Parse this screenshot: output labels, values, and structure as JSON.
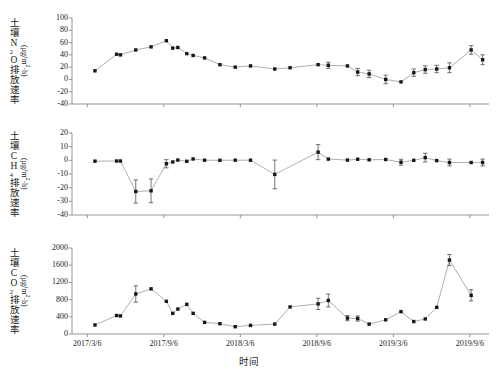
{
  "figure": {
    "xaxis_title": "时间",
    "xtick_labels": [
      "2017/3/6",
      "2017/9/6",
      "2018/3/6",
      "2018/9/6",
      "2019/3/6",
      "2019/9/6"
    ],
    "xtick_values": [
      0,
      6,
      12,
      18,
      24,
      30
    ],
    "xlim": [
      -1.2,
      31.5
    ]
  },
  "chart_data": [
    {
      "type": "line",
      "panel": "a",
      "title": "",
      "ylabel": "土壤N2O排放速率",
      "ylabel_cn_parts": [
        "土壤N",
        "2",
        "O排放速率"
      ],
      "yunit": "(μg/m2·h)",
      "xlabel": "",
      "ylim": [
        -40,
        100
      ],
      "yticks": [
        100,
        80,
        60,
        40,
        20,
        0,
        -20,
        -40
      ],
      "grid": false,
      "legend": "none",
      "x": [
        0.6,
        2.3,
        2.6,
        3.8,
        5.0,
        6.2,
        6.7,
        7.1,
        7.8,
        8.3,
        9.2,
        10.4,
        11.6,
        12.8,
        14.7,
        15.9,
        18.1,
        18.9,
        20.4,
        21.2,
        22.1,
        23.4,
        24.6,
        25.6,
        26.5,
        27.4,
        28.4,
        30.1
      ],
      "values": [
        14,
        41,
        40,
        48,
        53,
        63,
        51,
        52,
        42,
        39,
        35,
        24,
        20,
        22,
        17,
        19,
        24,
        23,
        22,
        12,
        9,
        0,
        -4,
        11,
        16,
        17,
        19,
        48
      ],
      "errors": [
        0,
        0,
        0,
        0,
        0,
        0,
        0,
        0,
        0,
        0,
        0,
        0,
        0,
        0,
        0,
        0,
        0,
        5,
        0,
        6,
        6,
        7,
        0,
        6,
        6,
        6,
        8,
        7
      ],
      "last_point": {
        "x": 31.0,
        "value": 32,
        "error": 8
      }
    },
    {
      "type": "line",
      "panel": "b",
      "title": "",
      "ylabel": "土壤CH4排放速率",
      "ylabel_cn_parts": [
        "土壤CH",
        "4",
        "排放速率"
      ],
      "yunit": "(μg/m2·h)",
      "xlabel": "",
      "ylim": [
        -40,
        20
      ],
      "yticks": [
        20,
        10,
        0,
        -10,
        -20,
        -30,
        -40
      ],
      "grid": false,
      "legend": "none",
      "x": [
        0.6,
        2.3,
        2.6,
        3.8,
        5.0,
        6.2,
        6.7,
        7.1,
        7.8,
        8.3,
        9.2,
        10.4,
        11.6,
        12.8,
        14.7,
        18.1,
        18.9,
        20.4,
        21.2,
        22.1,
        23.4,
        24.6,
        25.6,
        26.5,
        27.4,
        28.4,
        30.1,
        31.0
      ],
      "values": [
        -0.6,
        -0.5,
        -0.5,
        -22.8,
        -22.3,
        -2.5,
        -1.2,
        0.2,
        -0.7,
        1.0,
        0.1,
        0.0,
        0.1,
        0.1,
        -10.3,
        6.0,
        0.9,
        0.2,
        0.8,
        0.4,
        0.6,
        -1.4,
        0.0,
        2.0,
        -0.2,
        -1.6,
        -1.6,
        -1.6
      ],
      "errors": [
        0,
        0,
        0,
        8.5,
        8.7,
        3.0,
        0,
        0,
        0,
        0,
        0,
        0,
        0,
        0,
        10.5,
        5.5,
        0,
        0,
        0,
        0,
        0,
        2.2,
        0,
        3.2,
        0,
        2.5,
        0,
        2.5
      ]
    },
    {
      "type": "line",
      "panel": "c",
      "title": "",
      "ylabel": "土壤CO2排放速率",
      "ylabel_cn_parts": [
        "土壤CO",
        "2",
        "排放速率"
      ],
      "yunit": "(μg/m2·h)",
      "xlabel": "时间",
      "ylim": [
        0,
        2000
      ],
      "yticks": [
        2000,
        1600,
        1200,
        800,
        400,
        0
      ],
      "grid": false,
      "legend": "none",
      "x": [
        0.6,
        2.3,
        2.6,
        3.8,
        5.0,
        6.2,
        6.7,
        7.1,
        7.8,
        8.3,
        9.2,
        10.4,
        11.6,
        12.8,
        14.7,
        15.9,
        18.1,
        18.9,
        20.4,
        21.2,
        22.1,
        23.4,
        24.6,
        25.6,
        26.5,
        27.4,
        28.4,
        30.1
      ],
      "values": [
        210,
        430,
        420,
        930,
        1050,
        760,
        480,
        580,
        690,
        480,
        270,
        240,
        170,
        200,
        230,
        630,
        700,
        780,
        370,
        360,
        230,
        330,
        520,
        290,
        350,
        620,
        1720,
        900
      ],
      "errors": [
        0,
        0,
        0,
        190,
        0,
        0,
        0,
        0,
        0,
        0,
        0,
        0,
        0,
        0,
        0,
        0,
        130,
        150,
        60,
        60,
        0,
        0,
        0,
        0,
        0,
        0,
        130,
        130
      ]
    }
  ]
}
